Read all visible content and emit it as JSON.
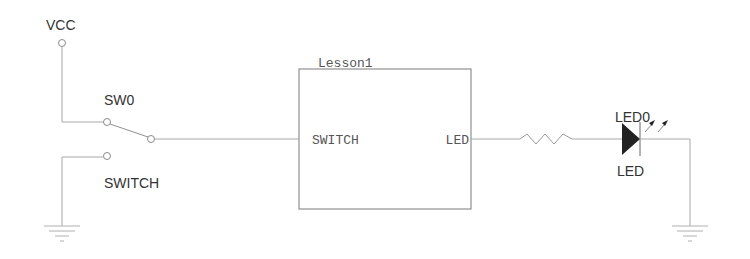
{
  "diagram": {
    "type": "schematic",
    "power": {
      "label": "VCC"
    },
    "switch": {
      "ref": "SW0",
      "value": "SWITCH"
    },
    "module": {
      "name": "Lesson1",
      "ports": {
        "input": "SWITCH",
        "output": "LED"
      }
    },
    "resistor": {
      "label": ""
    },
    "led": {
      "ref": "LED0",
      "value": "LED"
    },
    "grounds": [
      "ground-left",
      "ground-right"
    ],
    "colors": {
      "wire": "#a8a8a8",
      "text": "#333333",
      "led_fill": "#222222"
    }
  }
}
